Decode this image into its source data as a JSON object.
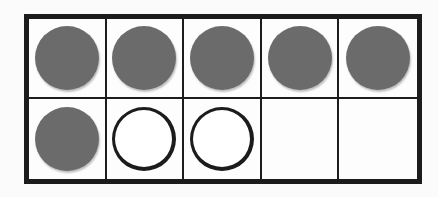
{
  "ten_frame": {
    "rows": 2,
    "columns": 5,
    "cells": [
      {
        "state": "filled"
      },
      {
        "state": "filled"
      },
      {
        "state": "filled"
      },
      {
        "state": "filled"
      },
      {
        "state": "filled"
      },
      {
        "state": "filled"
      },
      {
        "state": "empty-counter"
      },
      {
        "state": "empty-counter"
      },
      {
        "state": "blank"
      },
      {
        "state": "blank"
      }
    ],
    "filled_count": 6,
    "open_counter_count": 2,
    "blank_count": 2,
    "colors": {
      "filled": "#6b6b6b",
      "border": "#1c1c1c",
      "background": "#fdfdfd"
    }
  }
}
